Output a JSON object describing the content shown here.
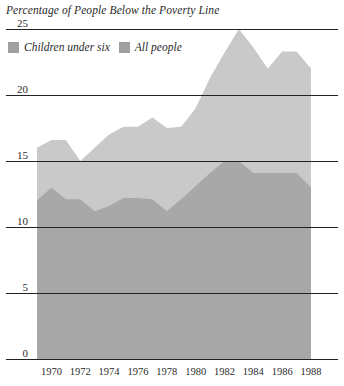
{
  "chart_data": {
    "type": "area",
    "title": "Percentage of People Below the Poverty Line",
    "xlabel": "",
    "ylabel": "",
    "ylim": [
      0,
      25
    ],
    "xlim": [
      1969,
      1988
    ],
    "grid": true,
    "legend_position": "top-left",
    "yticks": [
      "0",
      "5",
      "10",
      "15",
      "20",
      "25"
    ],
    "ytick_values": [
      0,
      5,
      10,
      15,
      20,
      25
    ],
    "xticks": [
      "1970",
      "1972",
      "1974",
      "1976",
      "1978",
      "1980",
      "1982",
      "1984",
      "1986",
      "1988"
    ],
    "xtick_values": [
      1970,
      1972,
      1974,
      1976,
      1978,
      1980,
      1982,
      1984,
      1986,
      1988
    ],
    "x": [
      1969,
      1970,
      1971,
      1972,
      1973,
      1974,
      1975,
      1976,
      1977,
      1978,
      1979,
      1980,
      1981,
      1982,
      1983,
      1984,
      1985,
      1986,
      1987,
      1988
    ],
    "series": [
      {
        "name": "Children under six",
        "color": "#c9c9c9",
        "values": [
          16.0,
          16.6,
          16.6,
          15.0,
          16.0,
          17.0,
          17.6,
          17.6,
          18.3,
          17.5,
          17.6,
          19.0,
          21.3,
          23.2,
          25.0,
          23.6,
          22.0,
          23.3,
          23.3,
          22.0
        ]
      },
      {
        "name": "All people",
        "color": "#a8a8a8",
        "values": [
          12.0,
          13.0,
          12.1,
          12.1,
          11.2,
          11.6,
          12.2,
          12.2,
          12.1,
          11.2,
          12.1,
          13.1,
          14.1,
          15.0,
          15.0,
          14.1,
          14.1,
          14.1,
          14.1,
          13.0
        ]
      }
    ]
  },
  "legend": {
    "items": [
      {
        "label": "Children under six",
        "color": "#a0a0a0"
      },
      {
        "label": "All people",
        "color": "#a0a0a0"
      }
    ]
  }
}
